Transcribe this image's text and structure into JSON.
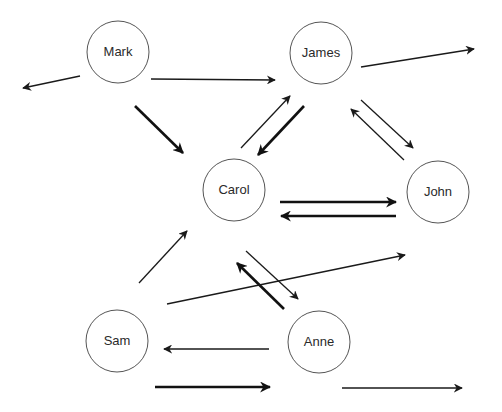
{
  "diagram": {
    "type": "directed-graph",
    "nodes": [
      {
        "id": "mark",
        "label": "Mark",
        "cx": 118,
        "cy": 52,
        "r": 31
      },
      {
        "id": "james",
        "label": "James",
        "cx": 321,
        "cy": 53,
        "r": 31
      },
      {
        "id": "carol",
        "label": "Carol",
        "cx": 234,
        "cy": 190,
        "r": 31
      },
      {
        "id": "john",
        "label": "John",
        "cx": 438,
        "cy": 192,
        "r": 31
      },
      {
        "id": "sam",
        "label": "Sam",
        "cx": 117,
        "cy": 341,
        "r": 31
      },
      {
        "id": "anne",
        "label": "Anne",
        "cx": 319,
        "cy": 342,
        "r": 31
      }
    ],
    "edges": [
      {
        "from": "Mark",
        "to": "(outside-left)",
        "weight": "thin",
        "x1": 80,
        "y1": 76,
        "x2": 23,
        "y2": 88
      },
      {
        "from": "Mark",
        "to": "James",
        "weight": "thin",
        "x1": 151,
        "y1": 79,
        "x2": 275,
        "y2": 80
      },
      {
        "from": "James",
        "to": "(outside-right)",
        "weight": "thin",
        "x1": 361,
        "y1": 67,
        "x2": 474,
        "y2": 49
      },
      {
        "from": "Mark",
        "to": "Carol",
        "weight": "thick",
        "x1": 135,
        "y1": 106,
        "x2": 183,
        "y2": 153
      },
      {
        "from": "Carol",
        "to": "James",
        "weight": "thin",
        "x1": 241,
        "y1": 148,
        "x2": 290,
        "y2": 96
      },
      {
        "from": "James",
        "to": "Carol",
        "weight": "thick",
        "x1": 304,
        "y1": 106,
        "x2": 258,
        "y2": 155
      },
      {
        "from": "James",
        "to": "John",
        "weight": "thin",
        "x1": 361,
        "y1": 100,
        "x2": 413,
        "y2": 148
      },
      {
        "from": "John",
        "to": "James",
        "weight": "thin",
        "x1": 404,
        "y1": 160,
        "x2": 351,
        "y2": 109
      },
      {
        "from": "Carol",
        "to": "John",
        "weight": "thick",
        "x1": 280,
        "y1": 202,
        "x2": 396,
        "y2": 202
      },
      {
        "from": "John",
        "to": "Carol",
        "weight": "thick",
        "x1": 396,
        "y1": 216,
        "x2": 281,
        "y2": 216
      },
      {
        "from": "Sam",
        "to": "Carol",
        "weight": "thin",
        "x1": 139,
        "y1": 283,
        "x2": 187,
        "y2": 231
      },
      {
        "from": "Carol",
        "to": "Anne",
        "weight": "thin",
        "x1": 246,
        "y1": 251,
        "x2": 298,
        "y2": 299
      },
      {
        "from": "Anne",
        "to": "Carol",
        "weight": "thick",
        "x1": 284,
        "y1": 309,
        "x2": 237,
        "y2": 263
      },
      {
        "from": "Sam",
        "to": "(outside-right)",
        "weight": "thin",
        "x1": 167,
        "y1": 304,
        "x2": 405,
        "y2": 255
      },
      {
        "from": "Anne",
        "to": "Sam",
        "weight": "thin",
        "x1": 269,
        "y1": 349,
        "x2": 164,
        "y2": 349
      },
      {
        "from": "Sam",
        "to": "(outside-bottom)",
        "weight": "thick",
        "x1": 155,
        "y1": 387,
        "x2": 270,
        "y2": 387
      },
      {
        "from": "Anne",
        "to": "(outside-right)",
        "weight": "thin",
        "x1": 342,
        "y1": 388,
        "x2": 462,
        "y2": 388
      }
    ]
  },
  "colors": {
    "background": "#ffffff",
    "node_stroke": "#555555",
    "edge": "#1a1a1a",
    "label": "#2a2a2a"
  }
}
